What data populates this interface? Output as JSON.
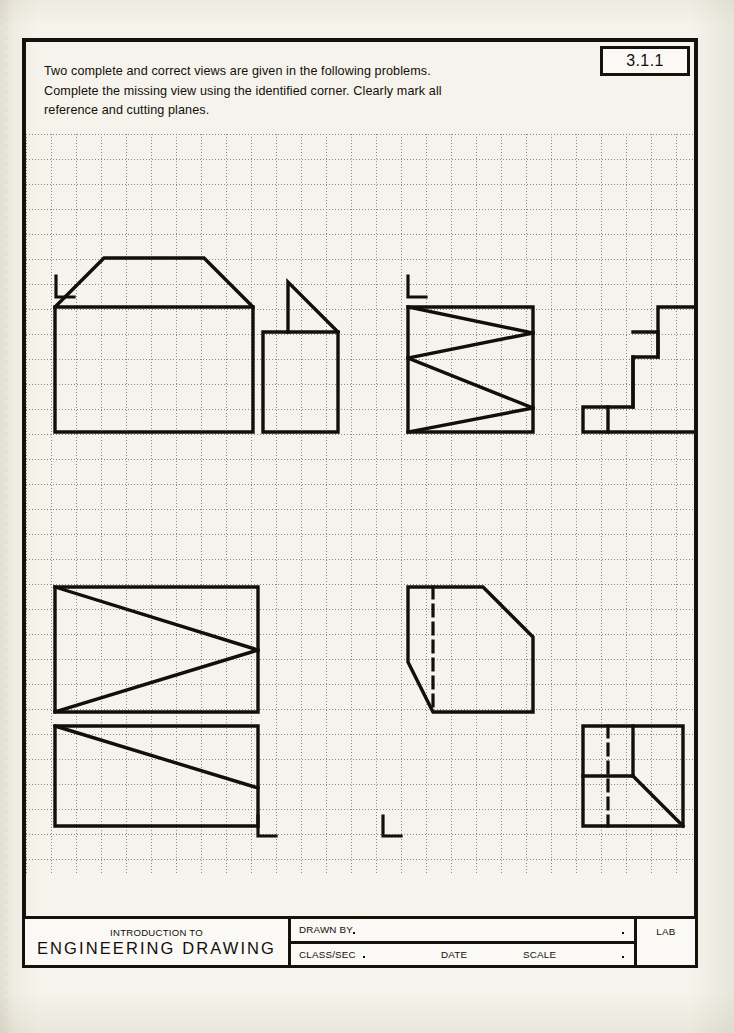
{
  "document": {
    "problem_number": "3.1.1",
    "instructions": "Two  complete and correct views are given in the following problems.\nComplete the missing view using the identified corner.  Clearly mark all\nreference and cutting planes."
  },
  "title_block": {
    "intro_label": "INTRODUCTION TO",
    "course_title": "ENGINEERING DRAWING",
    "drawn_by_label": "DRAWN BY",
    "class_sec_label": "CLASS/SEC",
    "date_label": "DATE",
    "scale_label": "SCALE",
    "lab_label": "LAB"
  },
  "grid": {
    "spacing_px": 25,
    "line_color": "#8d8980",
    "style": "dotted",
    "cols": 27,
    "rows": 30
  },
  "colors": {
    "ink": "#120f0b",
    "frame": "#15110d",
    "paper": "#faf9f5",
    "grid": "#8d8980"
  },
  "corner_markers": [
    {
      "name": "corner-marker-1",
      "label": "L",
      "x": 30,
      "y": 142
    },
    {
      "name": "corner-marker-2",
      "label": "L",
      "x": 382,
      "y": 142
    },
    {
      "name": "corner-marker-3",
      "label": "L",
      "x": 232,
      "y": 682
    },
    {
      "name": "corner-marker-4",
      "label": "L",
      "x": 357,
      "y": 682
    }
  ],
  "figures": [
    {
      "name": "figure-1-front-view",
      "description": "Front view: rectangle with chamfered top corners (house/trapezoid profile)",
      "line_style": "solid",
      "points": "29,298 29,173 78,124 178,124 227,173 227,298"
    },
    {
      "name": "figure-1-side-view",
      "description": "Side view: rectangle with right triangle on upper right",
      "line_style": "solid",
      "outline": "237,298 237,198 312,198 312,298",
      "detail_lines": [
        {
          "name": "triangle-vertical",
          "d": "M 262,198 L 262,148"
        },
        {
          "name": "triangle-hypotenuse",
          "d": "M 262,148 L 312,198"
        }
      ]
    },
    {
      "name": "figure-2-front-view",
      "description": "Front view: rectangle with zigzag staircase section lines",
      "line_style": "solid",
      "outline": "382,298 382,173 507,173 507,298",
      "detail_lines": [
        {
          "name": "zigzag-1",
          "d": "M 382,173 L 507,198"
        },
        {
          "name": "zigzag-2",
          "d": "M 507,198 L 382,223"
        },
        {
          "name": "zigzag-3",
          "d": "M 382,223 L 507,273"
        },
        {
          "name": "zigzag-4",
          "d": "M 507,273 L 382,298"
        }
      ]
    },
    {
      "name": "figure-2-pictorial-view",
      "description": "Pictorial: descending staircase block, three steps",
      "line_style": "solid",
      "outline": "557,298 557,273 607,273 607,223 632,223 632,173 682,173 682,298",
      "detail_lines": [
        {
          "name": "step-riser-1",
          "d": "M 582,298 L 582,273"
        },
        {
          "name": "step-tread-1",
          "d": "M 607,223 L 632,223"
        },
        {
          "name": "notch-vertical",
          "d": "M 632,198 L 632,223"
        },
        {
          "name": "notch-horizontal",
          "d": "M 607,223 L 632,223"
        }
      ]
    },
    {
      "name": "figure-3-top-view",
      "description": "Rectangle with V-shape: two diagonals meeting at right edge midpoint",
      "line_style": "solid",
      "outline": "29,453 29,578 232,578 232,453",
      "detail_lines": [
        {
          "name": "v-upper",
          "d": "M 29,453 L 232,516"
        },
        {
          "name": "v-lower",
          "d": "M 232,516 L 29,578"
        }
      ]
    },
    {
      "name": "figure-3-side-view",
      "description": "Chamfered block with hidden vertical line",
      "line_style": "solid",
      "outline": "382,453 382,528 407,578 507,578 507,503 457,453",
      "hidden_lines": [
        {
          "name": "hidden-vertical",
          "d": "M 407,453 L 407,578"
        }
      ],
      "detail_lines": [
        {
          "name": "top-edge",
          "d": "M 382,453 L 457,453"
        }
      ]
    },
    {
      "name": "figure-4-top-view",
      "description": "Rectangle with single diagonal from top-left descending to right",
      "line_style": "solid",
      "outline": "29,592 29,692 232,692 232,592",
      "detail_lines": [
        {
          "name": "diagonal",
          "d": "M 29,592 L 232,654"
        }
      ]
    },
    {
      "name": "figure-4-pictorial-view",
      "description": "Square with internal partition lines, hidden vertical line and diagonal",
      "line_style": "solid",
      "outline": "557,592 557,692 657,692 657,592",
      "hidden_lines": [
        {
          "name": "hidden-vertical",
          "d": "M 582,592 L 582,692"
        }
      ],
      "detail_lines": [
        {
          "name": "partition-vertical",
          "d": "M 607,592 L 607,642"
        },
        {
          "name": "partition-horizontal",
          "d": "M 557,642 L 607,642"
        },
        {
          "name": "diagonal",
          "d": "M 607,642 L 657,692"
        }
      ]
    }
  ]
}
